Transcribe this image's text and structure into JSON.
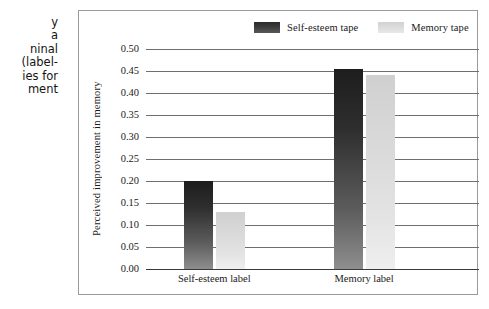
{
  "caption": {
    "lines": [
      "y",
      "a",
      "ninal",
      "(label-",
      "ies for",
      "ment"
    ]
  },
  "figure": {
    "legend": [
      {
        "label": "Self-esteem tape",
        "swatch": "dark",
        "color": "#3c3c3c"
      },
      {
        "label": "Memory tape",
        "swatch": "light",
        "color": "#dcdcdc"
      }
    ]
  },
  "chart_data": {
    "type": "bar",
    "title": "",
    "xlabel": "",
    "ylabel": "Perceived improvement in memory",
    "categories": [
      "Self-esteem label",
      "Memory label"
    ],
    "series": [
      {
        "name": "Self-esteem tape",
        "color": "#3c3c3c",
        "values": [
          0.2,
          0.455
        ]
      },
      {
        "name": "Memory tape",
        "color": "#dcdcdc",
        "values": [
          0.13,
          0.44
        ]
      }
    ],
    "ylim": [
      0.0,
      0.5
    ],
    "ytick_step": 0.05,
    "yticks": [
      "0.50",
      "0.45",
      "0.40",
      "0.35",
      "0.30",
      "0.25",
      "0.20",
      "0.15",
      "0.10",
      "0.05",
      "0.00"
    ],
    "ytick_values": [
      0.5,
      0.45,
      0.4,
      0.35,
      0.3,
      0.25,
      0.2,
      0.15,
      0.1,
      0.05,
      0.0
    ],
    "grid": true,
    "legend_position": "top"
  }
}
